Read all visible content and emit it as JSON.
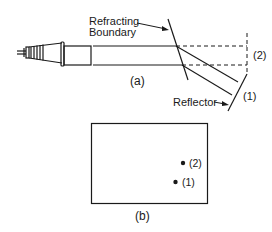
{
  "figure": {
    "part_a": {
      "caption": "(a)",
      "labels": {
        "refracting_boundary_line1": "Refracting",
        "refracting_boundary_line2": "Boundary",
        "reflector": "Reflector",
        "path1": "(1)",
        "path2": "(2)"
      }
    },
    "part_b": {
      "caption": "(b)",
      "points": [
        {
          "label": "(2)"
        },
        {
          "label": "(1)"
        }
      ]
    },
    "colors": {
      "stroke": "#1a1a1a",
      "background": "#ffffff"
    }
  }
}
